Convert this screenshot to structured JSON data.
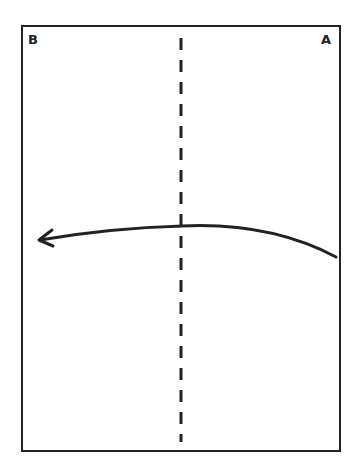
{
  "diagram": {
    "type": "folding-instruction",
    "sheet": {
      "shape": "rectangle",
      "stroke_color": "#222222",
      "fill_color": "#ffffff"
    },
    "corner_labels": {
      "top_left": "B",
      "top_right": "A"
    },
    "fold_line": {
      "style": "dashed",
      "orientation": "vertical",
      "position": "center"
    },
    "arrow": {
      "direction": "right-to-left",
      "shape": "curved",
      "meaning": "fold corner A side over to B side"
    }
  }
}
